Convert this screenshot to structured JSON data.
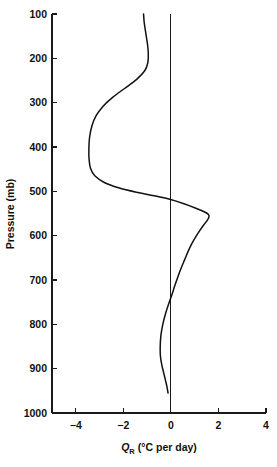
{
  "chart_data": {
    "type": "line",
    "title": "",
    "xlabel": "Q_R (°C per day)",
    "xlabel_symbol": "Q",
    "xlabel_subscript": "R",
    "xlabel_units": "(°C per day)",
    "ylabel": "Pressure (mb)",
    "xlim": [
      -5,
      4
    ],
    "ylim": [
      1000,
      100
    ],
    "y_inverted": true,
    "grid": false,
    "legend": null,
    "x_ticks": [
      -4,
      -2,
      0,
      2,
      4
    ],
    "x_tick_labels": [
      "−4",
      "−2",
      "0",
      "2",
      "4"
    ],
    "y_ticks": [
      100,
      200,
      300,
      400,
      500,
      600,
      700,
      800,
      900,
      1000
    ],
    "y_tick_labels": [
      "100",
      "200",
      "300",
      "400",
      "500",
      "600",
      "700",
      "800",
      "900",
      "1000"
    ],
    "reference_lines": [
      {
        "name": "zero-line",
        "orientation": "vertical",
        "value": 0
      }
    ],
    "series": [
      {
        "name": "radiative-heating-rate",
        "x_values": [
          -1.15,
          -1.12,
          -1.05,
          -0.98,
          -0.95,
          -0.97,
          -1.1,
          -1.45,
          -1.95,
          -2.45,
          -2.85,
          -3.15,
          -3.32,
          -3.42,
          -3.45,
          -3.44,
          -3.38,
          -3.2,
          -2.8,
          -2.2,
          -1.45,
          -0.7,
          -0.05,
          0.55,
          1.05,
          1.4,
          1.58,
          1.6,
          1.52,
          1.38,
          1.22,
          1.05,
          0.88,
          0.72,
          0.58,
          0.44,
          0.3,
          0.17,
          0.05,
          -0.08,
          -0.22,
          -0.34,
          -0.42,
          -0.45,
          -0.44,
          -0.38,
          -0.3,
          -0.22,
          -0.16,
          -0.12
        ],
        "y_values": [
          100,
          120,
          145,
          170,
          190,
          210,
          228,
          248,
          268,
          288,
          308,
          330,
          352,
          378,
          405,
          428,
          448,
          465,
          480,
          492,
          502,
          510,
          518,
          528,
          538,
          546,
          552,
          558,
          566,
          576,
          588,
          602,
          618,
          636,
          654,
          672,
          692,
          712,
          732,
          752,
          775,
          800,
          825,
          852,
          872,
          892,
          910,
          928,
          942,
          955
        ]
      }
    ],
    "annotations": []
  },
  "colors": {
    "curve": "#111111",
    "axis": "#1a1a1a",
    "background": "#ffffff"
  }
}
